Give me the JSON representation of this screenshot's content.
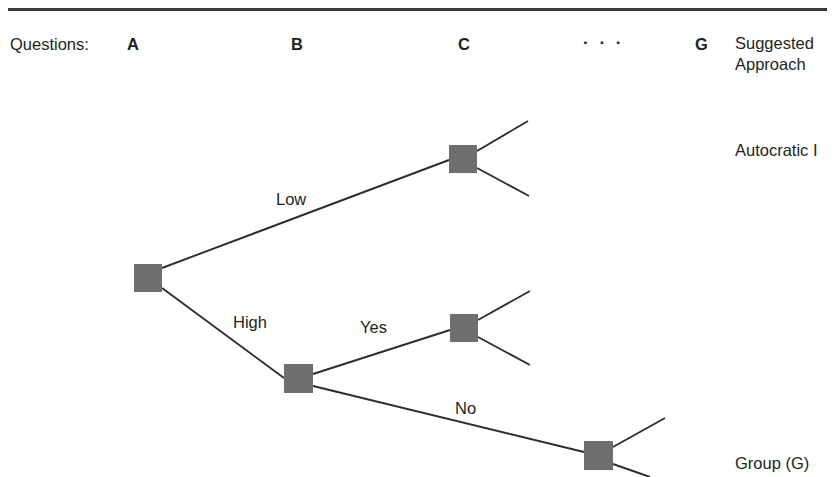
{
  "page": {
    "background": "#ffffff",
    "rule_color": "#3a3a3a",
    "text_color": "#231f20",
    "node_color": "#6f6f6f",
    "edge_color": "#2e2e2e",
    "width": 835,
    "height": 477
  },
  "header": {
    "questions_label": "Questions:",
    "columns": [
      {
        "id": "a",
        "label": "A"
      },
      {
        "id": "b",
        "label": "B"
      },
      {
        "id": "c",
        "label": "C"
      },
      {
        "id": "ellipsis",
        "label": "· · ·"
      },
      {
        "id": "g",
        "label": "G"
      }
    ],
    "result_column_line1": "Suggested",
    "result_column_line2": "Approach"
  },
  "outcomes": [
    {
      "id": "top",
      "label": "Autocratic I"
    },
    {
      "id": "bottom",
      "label": "Group (G)"
    }
  ],
  "chart_data": {
    "type": "diagram",
    "subtype": "decision-tree",
    "nodes": [
      {
        "id": "a1",
        "level": "A",
        "x": 134,
        "y": 264,
        "w": 28,
        "h": 28
      },
      {
        "id": "c1",
        "level": "C",
        "x": 449,
        "y": 145,
        "w": 28,
        "h": 28
      },
      {
        "id": "b1",
        "level": "B",
        "x": 284,
        "y": 364,
        "w": 29,
        "h": 29
      },
      {
        "id": "c2",
        "level": "C",
        "x": 450,
        "y": 314,
        "w": 28,
        "h": 28
      },
      {
        "id": "g1",
        "level": "G",
        "x": 584,
        "y": 441,
        "w": 29,
        "h": 29
      }
    ],
    "edges": [
      {
        "id": "a1-c1",
        "from": "a1",
        "to": "c1",
        "label": "Low",
        "x1": 162,
        "y1": 268,
        "x2": 449,
        "y2": 160,
        "label_x": 276,
        "label_y": 205
      },
      {
        "id": "a1-b1",
        "from": "a1",
        "to": "b1",
        "label": "High",
        "x1": 162,
        "y1": 288,
        "x2": 284,
        "y2": 378,
        "label_x": 233,
        "label_y": 328
      },
      {
        "id": "b1-c2",
        "from": "b1",
        "to": "c2",
        "label": "Yes",
        "x1": 313,
        "y1": 374,
        "x2": 450,
        "y2": 330,
        "label_x": 360,
        "label_y": 333
      },
      {
        "id": "b1-g1",
        "from": "b1",
        "to": "g1",
        "label": "No",
        "x1": 313,
        "y1": 386,
        "x2": 584,
        "y2": 452,
        "label_x": 455,
        "label_y": 414
      },
      {
        "id": "c1-up",
        "from": "c1",
        "to": null,
        "label": "",
        "x1": 477,
        "y1": 151,
        "x2": 528,
        "y2": 121,
        "label_x": null,
        "label_y": null
      },
      {
        "id": "c1-down",
        "from": "c1",
        "to": null,
        "label": "",
        "x1": 477,
        "y1": 168,
        "x2": 529,
        "y2": 196,
        "label_x": null,
        "label_y": null
      },
      {
        "id": "c2-up",
        "from": "c2",
        "to": null,
        "label": "",
        "x1": 478,
        "y1": 320,
        "x2": 530,
        "y2": 291,
        "label_x": null,
        "label_y": null
      },
      {
        "id": "c2-down",
        "from": "c2",
        "to": null,
        "label": "",
        "x1": 478,
        "y1": 337,
        "x2": 530,
        "y2": 365,
        "label_x": null,
        "label_y": null
      },
      {
        "id": "g1-up",
        "from": "g1",
        "to": null,
        "label": "",
        "x1": 613,
        "y1": 447,
        "x2": 665,
        "y2": 418,
        "label_x": null,
        "label_y": null
      },
      {
        "id": "g1-down",
        "from": "g1",
        "to": null,
        "label": "",
        "x1": 613,
        "y1": 464,
        "x2": 650,
        "y2": 477,
        "label_x": null,
        "label_y": null
      }
    ]
  }
}
